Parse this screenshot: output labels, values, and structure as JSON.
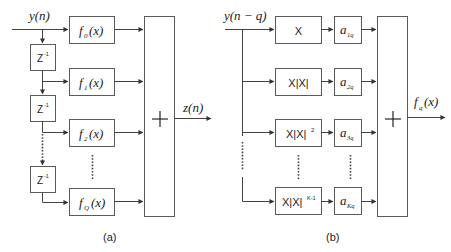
{
  "panel_a": {
    "input_label": "y(n)",
    "output_label": "z(n)",
    "delay_label": "Z",
    "delay_exp": "-1",
    "functions": [
      {
        "f": "f",
        "sub": "0",
        "arg": "(x)"
      },
      {
        "f": "f",
        "sub": "1",
        "arg": "(x)"
      },
      {
        "f": "f",
        "sub": "2",
        "arg": "(x)"
      },
      {
        "f": "f",
        "sub": "Q",
        "arg": "(x)"
      }
    ],
    "sum_symbol": "+",
    "caption": "(a)"
  },
  "panel_b": {
    "input_label": "y(n − q)",
    "output_label_f": "f",
    "output_label_sub": "q",
    "output_label_arg": "(x)",
    "nonlinear_terms": [
      {
        "base": "X",
        "exp": ""
      },
      {
        "base": "X|X|",
        "exp": ""
      },
      {
        "base": "X|X|",
        "exp": "2"
      },
      {
        "base": "X|X|",
        "exp": "K-1"
      }
    ],
    "coefficients": [
      {
        "a": "a",
        "sub": "1q"
      },
      {
        "a": "a",
        "sub": "2q"
      },
      {
        "a": "a",
        "sub": "3q"
      },
      {
        "a": "a",
        "sub": "Kq"
      }
    ],
    "sum_symbol": "+",
    "caption": "(b)"
  }
}
